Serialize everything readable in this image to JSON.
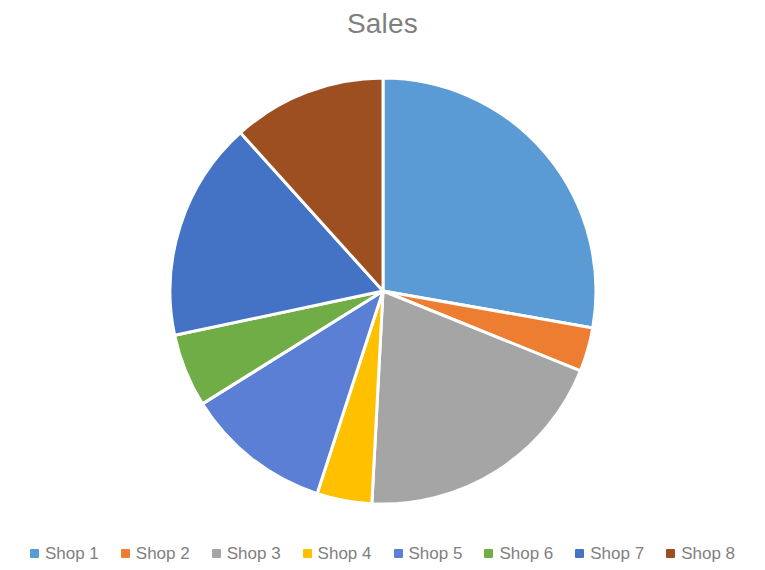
{
  "chart_data": {
    "type": "pie",
    "title": "Sales",
    "xlabel": "",
    "ylabel": "",
    "legend_position": "bottom",
    "grid": false,
    "start_angle_deg": 0,
    "direction": "clockwise",
    "categories": [
      "Shop 1",
      "Shop 2",
      "Shop 3",
      "Shop 4",
      "Shop 5",
      "Shop 6",
      "Shop 7",
      "Shop 8"
    ],
    "values": [
      100,
      12,
      71,
      15,
      40,
      20,
      60,
      42
    ],
    "value_unit": "degrees",
    "percentages": [
      27.8,
      3.3,
      19.7,
      4.2,
      11.1,
      5.6,
      16.7,
      11.7
    ],
    "colors": [
      "#5B9BD5",
      "#ED7D31",
      "#A5A5A5",
      "#FFC000",
      "#5B7FD4",
      "#70AD47",
      "#4472C4",
      "#9E4F22"
    ],
    "slice_angles_deg": [
      {
        "name": "Shop 1",
        "start": 0,
        "end": 100
      },
      {
        "name": "Shop 2",
        "start": 100,
        "end": 112
      },
      {
        "name": "Shop 3",
        "start": 112,
        "end": 183
      },
      {
        "name": "Shop 4",
        "start": 183,
        "end": 198
      },
      {
        "name": "Shop 5",
        "start": 198,
        "end": 238
      },
      {
        "name": "Shop 6",
        "start": 238,
        "end": 258
      },
      {
        "name": "Shop 7",
        "start": 258,
        "end": 318
      },
      {
        "name": "Shop 8",
        "start": 318,
        "end": 360
      }
    ],
    "geometry": {
      "center_x": 383,
      "center_y": 291,
      "radius": 213,
      "separator_color": "#ffffff",
      "separator_width": 3
    }
  },
  "title": {
    "text": "Sales",
    "color": "#7f7f7f"
  },
  "legend": {
    "items": [
      {
        "label": "Shop 1",
        "color": "#5B9BD5"
      },
      {
        "label": "Shop 2",
        "color": "#ED7D31"
      },
      {
        "label": "Shop 3",
        "color": "#A5A5A5"
      },
      {
        "label": "Shop 4",
        "color": "#FFC000"
      },
      {
        "label": "Shop 5",
        "color": "#5B7FD4"
      },
      {
        "label": "Shop 6",
        "color": "#70AD47"
      },
      {
        "label": "Shop 7",
        "color": "#4472C4"
      },
      {
        "label": "Shop 8",
        "color": "#9E4F22"
      }
    ]
  },
  "canvas": {
    "background": "#ffffff"
  }
}
